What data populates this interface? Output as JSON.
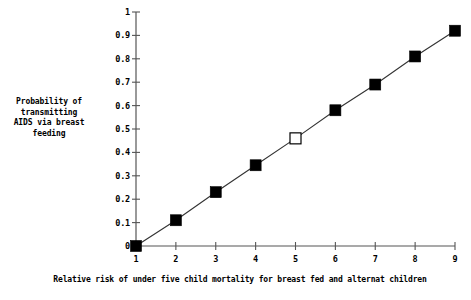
{
  "chart_data": {
    "type": "line",
    "title": "",
    "subtitle": "",
    "xlabel": "Relative risk of under five child mortality for breast fed and alternat children",
    "ylabel": "Probability of\ntransmitting\nAIDS via breast\nfeeding",
    "x": [
      1,
      2,
      3,
      4,
      5,
      6,
      7,
      8,
      9
    ],
    "values": [
      0,
      0.11,
      0.23,
      0.345,
      0.46,
      0.58,
      0.69,
      0.81,
      0.92
    ],
    "series": [
      {
        "name": "Probability of transmitting AIDS via breast feeding",
        "values": [
          0,
          0.11,
          0.23,
          0.345,
          0.46,
          0.58,
          0.69,
          0.81,
          0.92
        ],
        "marker": "square",
        "line_color": "#222222",
        "marker_color": "#000000"
      }
    ],
    "point_styles": [
      "filled",
      "filled",
      "filled",
      "filled",
      "open",
      "filled",
      "filled",
      "filled",
      "filled"
    ],
    "highlighted_point": {
      "x": 5,
      "y": 0.46,
      "style": "open"
    },
    "xlim": [
      1,
      9
    ],
    "ylim": [
      0,
      1
    ],
    "xticks": [
      "1",
      "2",
      "3",
      "4",
      "5",
      "6",
      "7",
      "8",
      "9"
    ],
    "yticks": [
      "0",
      "0.1",
      "0.2",
      "0.3",
      "0.4",
      "0.5",
      "0.6",
      "0.7",
      "0.8",
      "0.9",
      "1"
    ],
    "ytick_values": [
      0,
      0.1,
      0.2,
      0.3,
      0.4,
      0.5,
      0.6,
      0.7,
      0.8,
      0.9,
      1
    ],
    "grid": false,
    "legend": null,
    "legend_position": "none",
    "annotations": [],
    "colors": {
      "axis": "#555555",
      "line": "#333333",
      "marker_fill": "#000000",
      "marker_open_fill": "#ffffff",
      "background": "#ffffff",
      "text": "#000000"
    }
  }
}
